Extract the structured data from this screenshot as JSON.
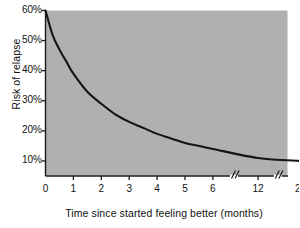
{
  "chart_data": {
    "type": "line",
    "title": "",
    "xlabel": "Time since started feeling better (months)",
    "ylabel": "Risk of relapse",
    "x_tick_labels": [
      "0",
      "1",
      "2",
      "3",
      "4",
      "5",
      "6",
      "12",
      "24"
    ],
    "x_tick_values": [
      0,
      1,
      2,
      3,
      4,
      5,
      6,
      12,
      24
    ],
    "y_tick_labels": [
      "60%",
      "50%",
      "40%",
      "30%",
      "20%",
      "10%"
    ],
    "y_tick_values": [
      60,
      50,
      40,
      30,
      20,
      10
    ],
    "ylim": [
      5,
      60
    ],
    "xlim": [
      0,
      24
    ],
    "grid": false,
    "legend": null,
    "axis_breaks": [
      "between 6 and 12",
      "between 12 and 24"
    ],
    "axis_break_symbol": "//",
    "series": [
      {
        "name": "Risk of relapse",
        "x": [
          0,
          0.25,
          0.5,
          0.75,
          1,
          1.5,
          2,
          2.5,
          3,
          3.5,
          4,
          4.5,
          5,
          5.5,
          6,
          12,
          24
        ],
        "values": [
          60,
          52,
          47,
          43,
          39,
          33,
          29,
          25.5,
          23,
          21,
          19,
          17.5,
          16,
          15,
          14,
          11,
          10
        ]
      }
    ],
    "plot_background_color": "#b0b0b0",
    "line_color": "#141414",
    "axis_color": "#1a1a1a"
  }
}
